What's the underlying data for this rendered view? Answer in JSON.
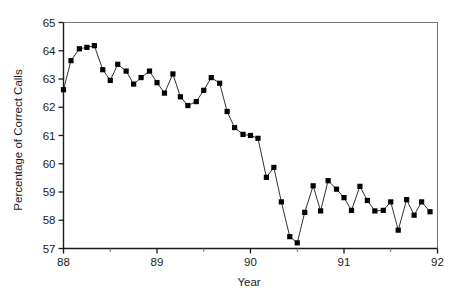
{
  "chart_data": {
    "type": "line",
    "title": "",
    "subtitle": "",
    "xlabel": "Year",
    "ylabel": "Percentage of Correct Calls",
    "xlim": [
      88,
      92
    ],
    "ylim": [
      57,
      65
    ],
    "xticks": [
      88,
      89,
      90,
      91,
      92
    ],
    "xtick_labels": [
      "88",
      "89",
      "90",
      "91",
      "92"
    ],
    "xminor_ticks": [
      88.5,
      89.5,
      90.5,
      91.5
    ],
    "yticks": [
      57,
      58,
      59,
      60,
      61,
      62,
      63,
      64,
      65
    ],
    "ytick_labels": [
      "57",
      "58",
      "59",
      "60",
      "61",
      "62",
      "63",
      "64",
      "65"
    ],
    "grid": false,
    "legend": null,
    "marker": "square",
    "marker_color": "#000000",
    "line_color": "#1a1a1a",
    "series": [
      {
        "name": "Percentage of Correct Calls",
        "x": [
          88.0,
          88.08,
          88.17,
          88.25,
          88.33,
          88.42,
          88.5,
          88.58,
          88.67,
          88.75,
          88.83,
          88.92,
          89.0,
          89.08,
          89.17,
          89.25,
          89.33,
          89.42,
          89.5,
          89.58,
          89.67,
          89.75,
          89.83,
          89.92,
          90.0,
          90.08,
          90.17,
          90.25,
          90.33,
          90.42,
          90.5,
          90.58,
          90.67,
          90.75,
          90.83,
          90.92,
          91.0,
          91.08,
          91.17,
          91.25,
          91.33,
          91.42,
          91.5,
          91.58,
          91.67,
          91.75,
          91.83,
          91.92
        ],
        "values": [
          62.62,
          63.65,
          64.07,
          64.12,
          64.18,
          63.33,
          62.95,
          63.52,
          63.28,
          62.82,
          63.05,
          63.28,
          62.87,
          62.5,
          63.18,
          62.37,
          62.06,
          62.2,
          62.6,
          63.05,
          62.85,
          61.85,
          61.28,
          61.04,
          61.0,
          60.9,
          59.52,
          59.87,
          58.65,
          57.42,
          57.2,
          58.28,
          59.22,
          58.33,
          59.4,
          59.1,
          58.8,
          58.35,
          59.2,
          58.7,
          58.33,
          58.35,
          58.65,
          57.65,
          58.73,
          58.18,
          58.65,
          58.3
        ]
      }
    ]
  }
}
